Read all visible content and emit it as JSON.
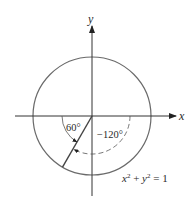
{
  "diagram": {
    "type": "unit-circle-angles",
    "axes": {
      "x_label": "x",
      "y_label": "y"
    },
    "circle": {
      "equation_lhs_x": "x",
      "equation_exp_x": "2",
      "equation_plus": " + ",
      "equation_lhs_y": "y",
      "equation_exp_y": "2",
      "equation_rhs": " = 1",
      "stroke": "#6a6a6a"
    },
    "angles": [
      {
        "label": "60°",
        "style": "solid",
        "description": "measured from negative x-axis"
      },
      {
        "label": "−120°",
        "style": "dashed",
        "description": "measured clockwise from positive x-axis"
      }
    ],
    "terminal_side_angle_deg": 240
  }
}
